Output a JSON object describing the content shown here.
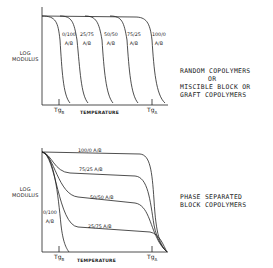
{
  "top_panel": {
    "ylabel": [
      "LOG",
      "MODULUS"
    ],
    "xlabel": "TEMPERATURE",
    "tg_b": {
      "main": "Tg",
      "sub": "B"
    },
    "tg_a": {
      "main": "Tg",
      "sub": "A"
    },
    "curves": [
      {
        "ratio": "0/100",
        "unit": "A/B"
      },
      {
        "ratio": "25/75",
        "unit": "A/B"
      },
      {
        "ratio": "50/50",
        "unit": "A/B"
      },
      {
        "ratio": "75/25",
        "unit": "A/B"
      },
      {
        "ratio": "100/0",
        "unit": "A/B"
      }
    ],
    "caption": [
      "RANDOM COPOLYMERS",
      "OR",
      "MISCIBLE BLOCK OR",
      "GRAFT COPOLYMERS"
    ]
  },
  "bottom_panel": {
    "ylabel": [
      "LOG",
      "MODULUS"
    ],
    "xlabel": "TEMPERATURE",
    "tg_b": {
      "main": "Tg",
      "sub": "B"
    },
    "tg_a": {
      "main": "Tg",
      "sub": "A"
    },
    "curves": [
      {
        "label": "100/0  A/B"
      },
      {
        "label": "75/25  A/B"
      },
      {
        "label": "50/50 A/B"
      },
      {
        "label": "25/75 A/B"
      },
      {
        "label": "0/100",
        "unit": "A/B"
      }
    ],
    "caption": [
      "PHASE SEPARATED",
      "BLOCK COPOLYMERS"
    ]
  }
}
